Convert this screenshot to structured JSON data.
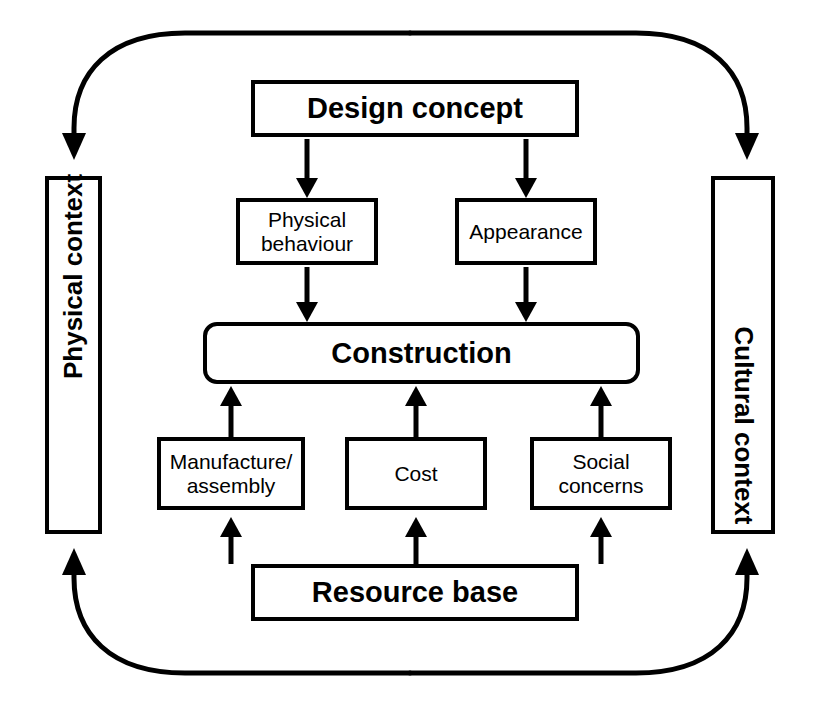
{
  "diagram": {
    "type": "flow-diagram",
    "background_color": "#ffffff",
    "stroke_color": "#000000",
    "nodes": {
      "design_concept": {
        "label": "Design concept",
        "emphasis": "bold",
        "shape": "rectangle"
      },
      "physical_behaviour": {
        "label": "Physical\nbehaviour",
        "emphasis": "regular",
        "shape": "rectangle"
      },
      "appearance": {
        "label": "Appearance",
        "emphasis": "regular",
        "shape": "rectangle"
      },
      "construction": {
        "label": "Construction",
        "emphasis": "bold",
        "shape": "rounded-rectangle"
      },
      "manufacture_assembly": {
        "label": "Manufacture/\nassembly",
        "emphasis": "regular",
        "shape": "rectangle"
      },
      "cost": {
        "label": "Cost",
        "emphasis": "regular",
        "shape": "rectangle"
      },
      "social_concerns": {
        "label": "Social\nconcerns",
        "emphasis": "regular",
        "shape": "rectangle"
      },
      "resource_base": {
        "label": "Resource base",
        "emphasis": "bold",
        "shape": "rectangle"
      },
      "physical_context": {
        "label": "Physical context",
        "emphasis": "bold",
        "shape": "rectangle",
        "orientation": "vertical-up"
      },
      "cultural_context": {
        "label": "Cultural context",
        "emphasis": "bold",
        "shape": "rectangle",
        "orientation": "vertical-down"
      }
    },
    "connectors": [
      {
        "id": "design-to-physical-behaviour",
        "from": "design_concept",
        "to": "physical_behaviour",
        "style": "straight",
        "direction": "down"
      },
      {
        "id": "design-to-appearance",
        "from": "design_concept",
        "to": "appearance",
        "style": "straight",
        "direction": "down"
      },
      {
        "id": "physical-behaviour-to-construction",
        "from": "physical_behaviour",
        "to": "construction",
        "style": "straight",
        "direction": "down"
      },
      {
        "id": "appearance-to-construction",
        "from": "appearance",
        "to": "construction",
        "style": "straight",
        "direction": "down"
      },
      {
        "id": "manufacture-to-construction",
        "from": "manufacture_assembly",
        "to": "construction",
        "style": "straight",
        "direction": "up"
      },
      {
        "id": "cost-to-construction",
        "from": "cost",
        "to": "construction",
        "style": "straight",
        "direction": "up"
      },
      {
        "id": "social-concerns-to-construction",
        "from": "social_concerns",
        "to": "construction",
        "style": "straight",
        "direction": "up"
      },
      {
        "id": "resource-base-to-manufacture",
        "from": "resource_base",
        "to": "manufacture_assembly",
        "style": "straight",
        "direction": "up"
      },
      {
        "id": "resource-base-to-cost",
        "from": "resource_base",
        "to": "cost",
        "style": "straight",
        "direction": "up"
      },
      {
        "id": "resource-base-to-social-concerns",
        "from": "resource_base",
        "to": "social_concerns",
        "style": "straight",
        "direction": "up"
      },
      {
        "id": "top-loop-to-physical-context",
        "from": "top-centre",
        "to": "physical_context",
        "style": "curved",
        "direction": "down"
      },
      {
        "id": "top-loop-to-cultural-context",
        "from": "top-centre",
        "to": "cultural_context",
        "style": "curved",
        "direction": "down"
      },
      {
        "id": "bottom-loop-to-physical-context",
        "from": "bottom-centre",
        "to": "physical_context",
        "style": "curved",
        "direction": "up"
      },
      {
        "id": "bottom-loop-to-cultural-context",
        "from": "bottom-centre",
        "to": "cultural_context",
        "style": "curved",
        "direction": "up"
      }
    ]
  }
}
